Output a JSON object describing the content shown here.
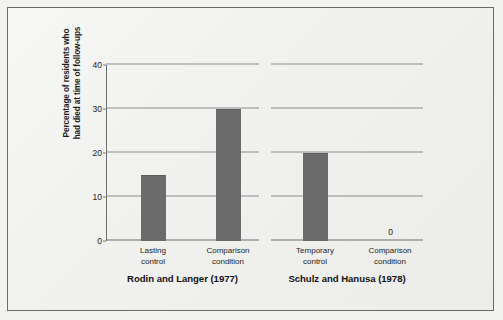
{
  "chart_data": {
    "type": "bar",
    "title": "",
    "xlabel": "",
    "ylabel_line1": "Percentage of residents who",
    "ylabel_line2": "had died at time of follow-ups",
    "ylim": [
      0,
      40
    ],
    "yticks": [
      0,
      10,
      20,
      30,
      40
    ],
    "ytick_labels": [
      "0",
      "10",
      "20",
      "30",
      "40"
    ],
    "grid": true,
    "legend": "none",
    "bar_color": "#6b6b6b",
    "panels": [
      {
        "caption": "Rodin and Langer (1977)",
        "categories": [
          "Lasting control",
          "Comparison condition"
        ],
        "category_lines": [
          {
            "line1": "Lasting",
            "line2": "control"
          },
          {
            "line1": "Comparison",
            "line2": "condition"
          }
        ],
        "values": [
          15,
          30
        ],
        "value_labels": [
          "",
          ""
        ]
      },
      {
        "caption": "Schulz and Hanusa (1978)",
        "categories": [
          "Temporary control",
          "Comparison condition"
        ],
        "category_lines": [
          {
            "line1": "Temporary",
            "line2": "control"
          },
          {
            "line1": "Comparison",
            "line2": "condition"
          }
        ],
        "values": [
          20,
          0
        ],
        "value_labels": [
          "",
          "0"
        ]
      }
    ]
  }
}
